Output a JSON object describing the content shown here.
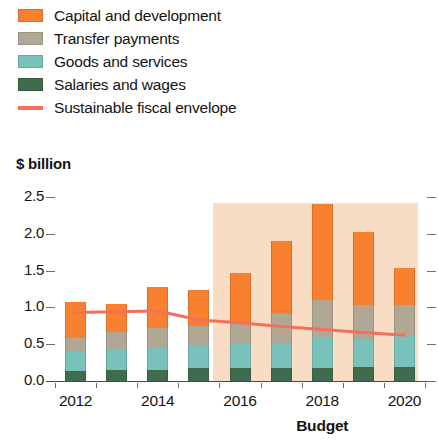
{
  "legend": {
    "items": [
      {
        "label": "Capital and development",
        "color": "#f8802f",
        "type": "box",
        "icon": "legend-swatch"
      },
      {
        "label": "Transfer payments",
        "color": "#b0a894",
        "type": "box",
        "icon": "legend-swatch"
      },
      {
        "label": "Goods and services",
        "color": "#79c2bc",
        "type": "box",
        "icon": "legend-swatch"
      },
      {
        "label": "Salaries and wages",
        "color": "#3f6b4e",
        "type": "box",
        "icon": "legend-swatch"
      },
      {
        "label": "Sustainable fiscal envelope",
        "color": "#f4705a",
        "type": "line",
        "icon": "legend-line"
      }
    ]
  },
  "axis": {
    "y_title": "$ billion",
    "y_ticks": [
      "2.5",
      "2.0",
      "1.5",
      "1.0",
      "0.5",
      "0.0"
    ],
    "x_ticks": [
      "2012",
      "2014",
      "2016",
      "2018",
      "2020"
    ],
    "x_title": "Budget"
  },
  "chart_data": {
    "type": "bar",
    "title": "",
    "subtitle": "",
    "xlabel": "Budget",
    "ylabel": "$ billion",
    "ylim": [
      0.0,
      2.5
    ],
    "yticks": [
      0.0,
      0.5,
      1.0,
      1.5,
      2.0,
      2.5
    ],
    "grid": false,
    "legend_position": "above-plot",
    "stacked": true,
    "categories": [
      "2012",
      "2013",
      "2014",
      "2015",
      "2016",
      "2017",
      "2018",
      "2019",
      "2020"
    ],
    "series": [
      {
        "name": "Salaries and wages",
        "color": "#3f6b4e",
        "values": [
          0.14,
          0.15,
          0.15,
          0.17,
          0.17,
          0.18,
          0.18,
          0.19,
          0.19
        ]
      },
      {
        "name": "Goods and services",
        "color": "#79c2bc",
        "values": [
          0.26,
          0.27,
          0.3,
          0.31,
          0.33,
          0.34,
          0.42,
          0.37,
          0.44
        ]
      },
      {
        "name": "Transfer payments",
        "color": "#b0a894",
        "values": [
          0.19,
          0.24,
          0.27,
          0.27,
          0.27,
          0.39,
          0.5,
          0.47,
          0.4
        ]
      },
      {
        "name": "Capital and development",
        "color": "#f8802f",
        "values": [
          0.48,
          0.38,
          0.56,
          0.48,
          0.7,
          0.99,
          1.3,
          1.0,
          0.5
        ]
      }
    ],
    "totals": [
      1.07,
      1.04,
      1.28,
      1.23,
      1.47,
      1.9,
      2.4,
      2.03,
      1.53
    ],
    "overlay_line": {
      "name": "Sustainable fiscal envelope",
      "color": "#f4705a",
      "values": [
        0.93,
        0.94,
        0.95,
        0.83,
        0.79,
        0.74,
        0.7,
        0.66,
        0.62
      ]
    },
    "shaded_region": {
      "label": "",
      "from": "2016",
      "to": "2020",
      "color": "#f9dcc4"
    }
  }
}
